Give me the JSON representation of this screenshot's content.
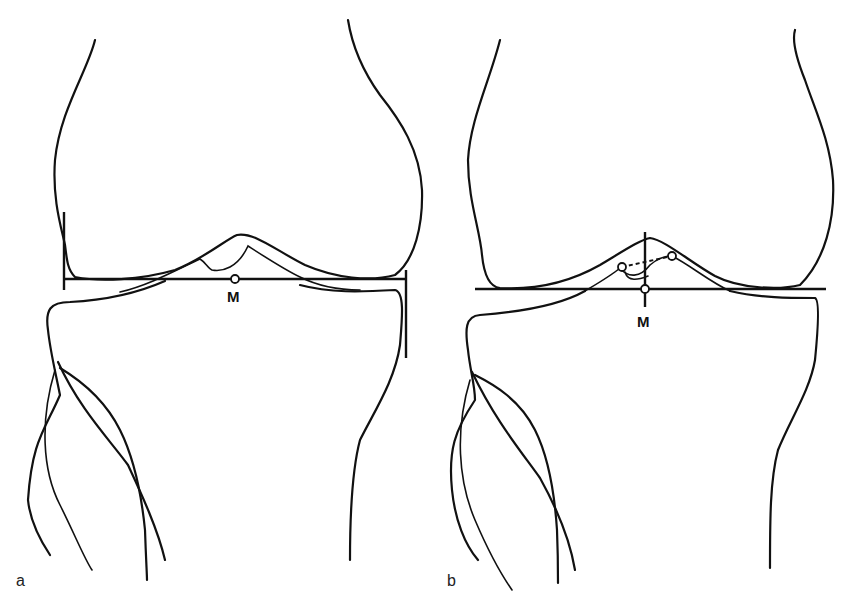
{
  "figure": {
    "panels": [
      {
        "id": "a",
        "label": "a",
        "midpoint_label": "M",
        "description": "Knee joint outline (femur and tibia) with a horizontal joint line bounded by vertical end ticks; midpoint M marked with an open circle"
      },
      {
        "id": "b",
        "label": "b",
        "midpoint_label": "M",
        "description": "Knee joint outline with horizontal joint line and vertical line through midpoint M; two open circles on intercondylar eminences joined by a dashed line"
      }
    ],
    "colors": {
      "line": "#111111",
      "background": "#ffffff"
    }
  }
}
